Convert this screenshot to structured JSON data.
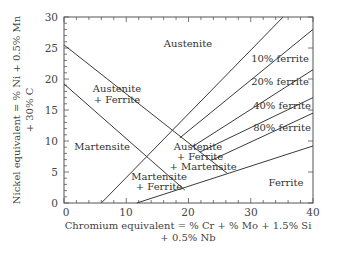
{
  "chart_data": {
    "type": "line",
    "title": "",
    "xlabel": "Chromium equivalent = % Cr + % Mo + 1.5% Si + 0.5% Nb",
    "xlabel_lines": [
      "Chromium equivalent = % Cr + % Mo + 1.5% Si",
      "+ 0.5% Nb"
    ],
    "ylabel": "Nickel equivalent = % Ni + 0.5% Mn + 30% C",
    "ylabel_lines": [
      "Nickel equivalent = % Ni + 0.5% Mn",
      "+ 30% C"
    ],
    "xlim": [
      0,
      40
    ],
    "ylim": [
      0,
      30
    ],
    "x_ticks": [
      0,
      10,
      20,
      30,
      40
    ],
    "y_ticks": [
      0,
      5,
      10,
      15,
      20,
      25,
      30
    ],
    "grid": false,
    "legend": "none",
    "series": [
      {
        "name": "austenite / austenite+ferrite boundary",
        "points": [
          [
            0,
            25.5
          ],
          [
            26.2,
            4.8
          ]
        ]
      },
      {
        "name": "austenite+ferrite / martensite boundary",
        "points": [
          [
            0,
            19.2
          ],
          [
            19.4,
            2.1
          ]
        ]
      },
      {
        "name": "0% ferrite (martensite limit)",
        "points": [
          [
            6,
            0
          ],
          [
            35.2,
            30
          ]
        ]
      },
      {
        "name": "10% ferrite",
        "points": [
          [
            18.6,
            10.5
          ],
          [
            40,
            28
          ]
        ]
      },
      {
        "name": "20% ferrite",
        "points": [
          [
            20.5,
            9.0
          ],
          [
            40,
            21.5
          ]
        ]
      },
      {
        "name": "40% ferrite",
        "points": [
          [
            21.8,
            8.2
          ],
          [
            40,
            17
          ]
        ]
      },
      {
        "name": "80% ferrite",
        "points": [
          [
            23.7,
            6.9
          ],
          [
            40,
            14.5
          ]
        ]
      },
      {
        "name": "ferrite boundary",
        "points": [
          [
            11.7,
            0
          ],
          [
            40,
            9.2
          ]
        ]
      }
    ],
    "annotations": [
      {
        "text": "Austenite",
        "x": 20,
        "y": 25
      },
      {
        "text": "Austenite",
        "x": 8.5,
        "y": 18.5
      },
      {
        "text": "+ Ferrite",
        "x": 8.5,
        "y": 16.5
      },
      {
        "text": "Martensite",
        "x": 6,
        "y": 9.2
      },
      {
        "text": "Austenite",
        "x": 21,
        "y": 9.2
      },
      {
        "text": "+ Ferrite",
        "x": 21.2,
        "y": 7.6
      },
      {
        "text": "+ Martensite",
        "x": 21.8,
        "y": 6.0
      },
      {
        "text": "Martensite",
        "x": 15,
        "y": 4.2
      },
      {
        "text": "+ Ferrite",
        "x": 15,
        "y": 2.7
      },
      {
        "text": "10% ferrite",
        "x": 34.5,
        "y": 23.3
      },
      {
        "text": "20% ferrite",
        "x": 34.5,
        "y": 19.3
      },
      {
        "text": "40% ferrite",
        "x": 35,
        "y": 15.5
      },
      {
        "text": "80% ferrite",
        "x": 35,
        "y": 12.5
      },
      {
        "text": "Ferrite",
        "x": 35,
        "y": 3.8
      }
    ]
  },
  "labels": {
    "austenite": "Austenite",
    "austenite_ferrite_1": "Austenite",
    "austenite_ferrite_2": "+ Ferrite",
    "martensite": "Martensite",
    "afm_1": "Austenite",
    "afm_2": "+ Ferrite",
    "afm_3": "+ Martensite",
    "mf_1": "Martensite",
    "mf_2": "+ Ferrite",
    "ferrite_10": "10% ferrite",
    "ferrite_20": "20% ferrite",
    "ferrite_40": "40% ferrite",
    "ferrite_80": "80% ferrite",
    "ferrite": "Ferrite"
  },
  "axes": {
    "x_ticks": [
      "0",
      "10",
      "20",
      "30",
      "40"
    ],
    "y_ticks": [
      "0",
      "5",
      "10",
      "15",
      "20",
      "25",
      "30"
    ],
    "xlabel_line1": "Chromium equivalent = % Cr + % Mo + 1.5% Si",
    "xlabel_line2": "+ 0.5% Nb",
    "ylabel_line1": "Nickel equivalent = % Ni + 0.5% Mn",
    "ylabel_line2": "+ 30% C"
  },
  "colors": {
    "line": "#3a3a3a",
    "axis": "#555555",
    "text": "#333333"
  }
}
